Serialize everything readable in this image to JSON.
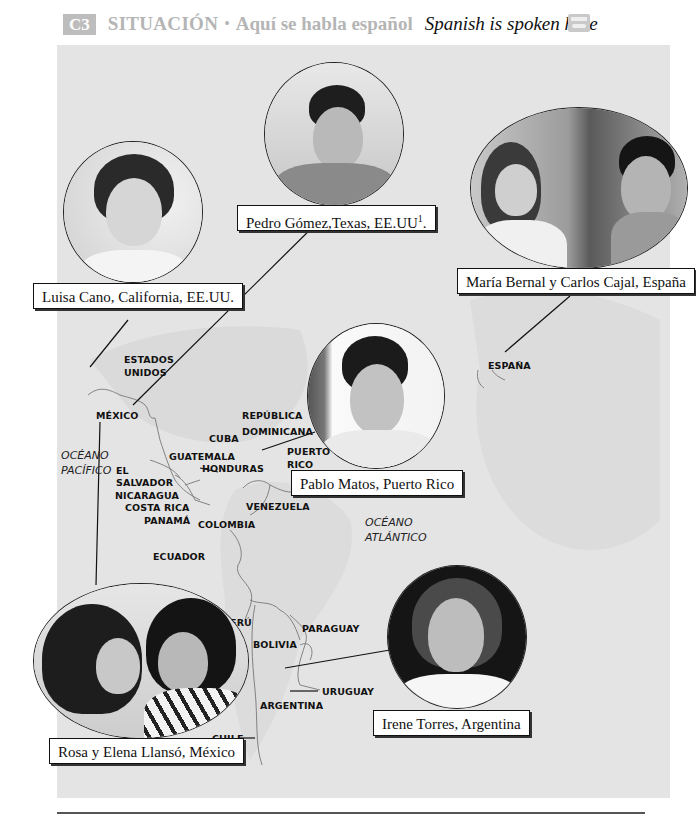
{
  "header": {
    "section_badge": "C3",
    "title": "SITUACIÓN",
    "separator": "•",
    "subtitle": "Aquí se habla español",
    "translation": "Spanish is spoken here",
    "audio_icon": "cassette-icon"
  },
  "map": {
    "countries": [
      {
        "id": "estados-unidos",
        "label": "ESTADOS\nUNIDOS"
      },
      {
        "id": "mexico",
        "label": "MÉXICO"
      },
      {
        "id": "republica-dominicana",
        "label": "REPÚBLICA\nDOMINICANA"
      },
      {
        "id": "cuba",
        "label": "CUBA"
      },
      {
        "id": "puerto-rico",
        "label": "PUERTO\nRICO"
      },
      {
        "id": "guatemala",
        "label": "GUATEMALA"
      },
      {
        "id": "honduras",
        "label": "HONDURAS"
      },
      {
        "id": "el-salvador",
        "label": "EL\nSALVADOR"
      },
      {
        "id": "nicaragua",
        "label": "NICARAGUA"
      },
      {
        "id": "costa-rica",
        "label": "COSTA RICA"
      },
      {
        "id": "panama",
        "label": "PANAMÁ"
      },
      {
        "id": "colombia",
        "label": "COLOMBIA"
      },
      {
        "id": "venezuela",
        "label": "VENEZUELA"
      },
      {
        "id": "ecuador",
        "label": "ECUADOR"
      },
      {
        "id": "peru",
        "label": "PERÚ"
      },
      {
        "id": "bolivia",
        "label": "BOLIVIA"
      },
      {
        "id": "paraguay",
        "label": "PARAGUAY"
      },
      {
        "id": "uruguay",
        "label": "URUGUAY"
      },
      {
        "id": "argentina",
        "label": "ARGENTINA"
      },
      {
        "id": "chile",
        "label": "CHILE"
      },
      {
        "id": "espana",
        "label": "ESPAÑA"
      }
    ],
    "oceans": [
      {
        "id": "pacifico",
        "label": "OCÉANO\nPACÍFICO"
      },
      {
        "id": "atlantico",
        "label": "OCÉANO\nATLÁNTICO"
      }
    ]
  },
  "people": [
    {
      "id": "luisa",
      "caption": "Luisa Cano, California, EE.UU."
    },
    {
      "id": "pedro",
      "caption": "Pedro Gómez,Texas, EE.UU",
      "footnote": "1",
      "caption_end": "."
    },
    {
      "id": "maria-carlos",
      "caption": "María Bernal y Carlos Cajal, España"
    },
    {
      "id": "pablo",
      "caption": "Pablo Matos, Puerto Rico"
    },
    {
      "id": "rosa-elena",
      "caption": "Rosa y Elena Llansó, México"
    },
    {
      "id": "irene",
      "caption": "Irene Torres, Argentina"
    }
  ],
  "colors": {
    "map_background": "#e4e4e4",
    "header_gray": "#b5b5b5",
    "text": "#111111"
  }
}
